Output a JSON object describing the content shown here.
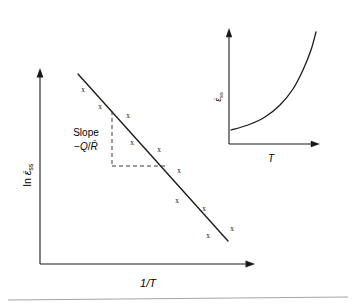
{
  "figure": {
    "kind": "scientific-line-plot-with-inset",
    "background_color": "#ffffff",
    "ink_color": "#1a1a1a",
    "baseline_rule_color": "#9a9a9a"
  },
  "main_plot": {
    "y_axis_label": "ln ε̇ss",
    "y_axis_label_parts": {
      "prefix": "ln ",
      "symbol": "ε̇",
      "subscript": "ss"
    },
    "x_axis_label": "1/T",
    "annotation_line1": "Slope",
    "annotation_line2": "−Q/R̄",
    "annotation_line2_parts": {
      "sign": "−",
      "numerator": "Q",
      "slash": "/",
      "denominator": "R̄"
    }
  },
  "inset_plot": {
    "y_axis_label": "ε̇ss",
    "y_axis_label_parts": {
      "symbol": "ε̇",
      "subscript": "ss"
    },
    "x_axis_label": "T"
  },
  "chart_data": {
    "type": "scatter",
    "title": "",
    "subtitle": "",
    "xlabel": "1/T",
    "ylabel": "ln ε̇ss",
    "grid": false,
    "legend": false,
    "annotations": [
      {
        "text": "Slope −Q/R̄",
        "x_px": 86,
        "y_px": 140,
        "kind": "slope-triangle-label"
      }
    ],
    "axis_style": "arrow-headed open axes, no tick marks, no tick labels",
    "xlim_px": [
      40,
      255
    ],
    "ylim_px": [
      264,
      70
    ],
    "series": [
      {
        "name": "steady-state creep rate data",
        "marker": "x",
        "points_px": [
          {
            "x": 83,
            "y": 90
          },
          {
            "x": 100,
            "y": 107
          },
          {
            "x": 128,
            "y": 116
          },
          {
            "x": 132,
            "y": 143
          },
          {
            "x": 159,
            "y": 150
          },
          {
            "x": 179,
            "y": 171
          },
          {
            "x": 177,
            "y": 201
          },
          {
            "x": 204,
            "y": 209
          },
          {
            "x": 208,
            "y": 236
          },
          {
            "x": 232,
            "y": 229
          }
        ]
      },
      {
        "name": "least-squares fit line",
        "type": "line",
        "from_px": {
          "x": 78,
          "y": 74
        },
        "to_px": {
          "x": 228,
          "y": 241
        },
        "slope_meaning": "−Q/R̄"
      }
    ],
    "slope_triangle_px": {
      "apex": {
        "x": 112,
        "y": 111
      },
      "vertical_bottom": {
        "x": 112,
        "y": 166
      },
      "horizontal_right": {
        "x": 168,
        "y": 166
      },
      "style": "dashed"
    },
    "inset": {
      "type": "line",
      "xlabel": "T",
      "ylabel": "ε̇ss",
      "grid": false,
      "legend": false,
      "shape": "monotonic exponential rise",
      "xlim_px": [
        229,
        320
      ],
      "ylim_px": [
        144,
        28
      ],
      "curve_points_px": [
        {
          "x": 231,
          "y": 130
        },
        {
          "x": 248,
          "y": 125
        },
        {
          "x": 265,
          "y": 117
        },
        {
          "x": 280,
          "y": 105
        },
        {
          "x": 293,
          "y": 89
        },
        {
          "x": 303,
          "y": 70
        },
        {
          "x": 311,
          "y": 50
        },
        {
          "x": 316,
          "y": 32
        }
      ]
    }
  }
}
